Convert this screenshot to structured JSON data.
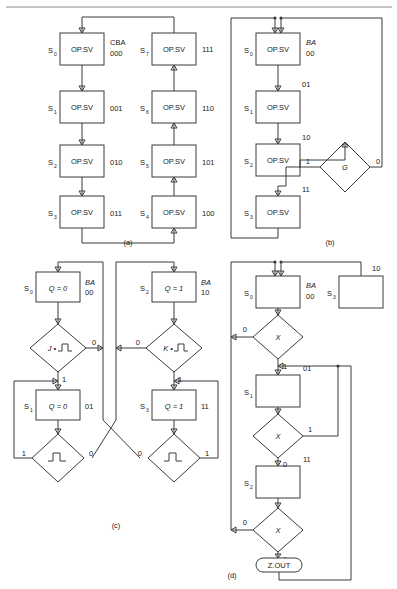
{
  "figure": {
    "captions": {
      "a": "(a)",
      "b": "(b)",
      "c": "(c)",
      "d": "(d)"
    }
  },
  "panel_a": {
    "caption": "(a)",
    "header_label": "CBA",
    "op_label": "OP.SV",
    "left_column": [
      {
        "state": "S",
        "sub": "0",
        "op": "OP.SV",
        "code": "000"
      },
      {
        "state": "S",
        "sub": "1",
        "op": "OP.SV",
        "code": "001"
      },
      {
        "state": "S",
        "sub": "2",
        "op": "OP.SV",
        "code": "010"
      },
      {
        "state": "S",
        "sub": "3",
        "op": "OP.SV",
        "code": "011"
      }
    ],
    "right_column": [
      {
        "state": "S",
        "sub": "7",
        "op": "OP.SV",
        "code": "111"
      },
      {
        "state": "S",
        "sub": "6",
        "op": "OP.SV",
        "code": "110"
      },
      {
        "state": "S",
        "sub": "5",
        "op": "OP.SV",
        "code": "101"
      },
      {
        "state": "S",
        "sub": "4",
        "op": "OP.SV",
        "code": "100"
      }
    ]
  },
  "panel_b": {
    "caption": "(b)",
    "header_label": "BA",
    "op_label": "OP.SV",
    "states": [
      {
        "state": "S",
        "sub": "0",
        "op": "OP.SV",
        "code": "00"
      },
      {
        "state": "S",
        "sub": "1",
        "op": "OP.SV",
        "code": "01"
      },
      {
        "state": "S",
        "sub": "2",
        "op": "OP.SV",
        "code": "10"
      },
      {
        "state": "S",
        "sub": "3",
        "op": "OP.SV",
        "code": "11"
      }
    ],
    "decision": {
      "label": "G",
      "branch_true": "1",
      "branch_false": "0"
    }
  },
  "panel_c": {
    "caption": "(c)",
    "header_label": "BA",
    "left_branch": {
      "state_top": {
        "state": "S",
        "sub": "0",
        "op": "Q = 0",
        "code": "00"
      },
      "decision_top": {
        "label": "J •",
        "glyph": "pulse-icon",
        "branch_false": "0",
        "branch_true": "1"
      },
      "state_bottom": {
        "state": "S",
        "sub": "1",
        "op": "Q = 0",
        "code": "01"
      },
      "decision_bottom": {
        "label": "",
        "glyph": "pulse-icon",
        "branch_left": "1",
        "branch_right": "0"
      }
    },
    "right_branch": {
      "state_top": {
        "state": "S",
        "sub": "2",
        "op": "Q = 1",
        "code": "10"
      },
      "decision_top": {
        "label": "K •",
        "glyph": "pulse-icon",
        "branch_false": "0",
        "branch_true": "1"
      },
      "state_bottom": {
        "state": "S",
        "sub": "3",
        "op": "Q = 1",
        "code": "11"
      },
      "decision_bottom": {
        "label": "",
        "glyph": "pulse-icon",
        "branch_left": "0",
        "branch_right": "1"
      }
    }
  },
  "panel_d": {
    "caption": "(d)",
    "header_label": "BA",
    "states": [
      {
        "state": "S",
        "sub": "0",
        "code": "00"
      },
      {
        "state": "S",
        "sub": "3",
        "code": "10"
      },
      {
        "state": "S",
        "sub": "1",
        "code": "01"
      },
      {
        "state": "S",
        "sub": "2",
        "code": "11"
      }
    ],
    "decisions": [
      {
        "label": "X",
        "branch_false": "0",
        "branch_true": "1"
      },
      {
        "label": "X",
        "branch_false": "0",
        "branch_true": "1"
      },
      {
        "label": "X",
        "branch_false": "0",
        "branch_true": "1"
      }
    ],
    "output": {
      "label": "Z.OUT"
    }
  }
}
